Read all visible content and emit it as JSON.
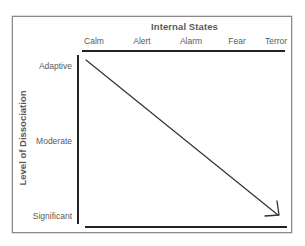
{
  "diagram": {
    "x_axis": {
      "title": "Internal States",
      "labels": [
        "Calm",
        "Alert",
        "Alarm",
        "Fear",
        "Terror"
      ]
    },
    "y_axis": {
      "title": "Level of Dissociation",
      "labels": [
        "Adaptive",
        "Moderate",
        "Significant"
      ]
    },
    "arrow": {
      "from": "Calm / Adaptive",
      "to": "Terror / Significant",
      "direction": "down-right",
      "color": "#333333"
    },
    "colors": {
      "text": "#5a5a5a",
      "rules": "#222222",
      "frame": "#8a8a8a",
      "background": "#ffffff"
    }
  }
}
